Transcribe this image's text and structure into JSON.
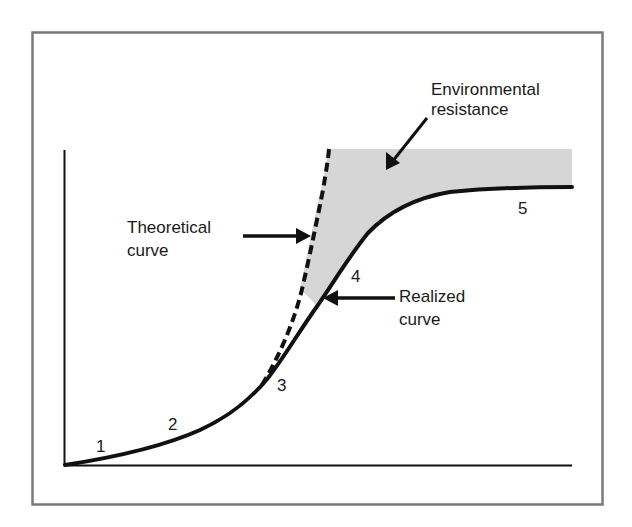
{
  "diagram": {
    "title": "",
    "type": "logistic growth curve",
    "colors": {
      "frame": "#7a7a7a",
      "axis": "#111111",
      "curve": "#111111",
      "shade": "#d6d6d6",
      "text": "#1a1a1a"
    },
    "labels": {
      "environmental_line1": "Environmental",
      "environmental_line2": "resistance",
      "theoretical_line1": "Theoretical",
      "theoretical_line2": "curve",
      "realized_line1": "Realized",
      "realized_line2": "curve"
    },
    "stages": [
      {
        "id": "1",
        "label": "1"
      },
      {
        "id": "2",
        "label": "2"
      },
      {
        "id": "3",
        "label": "3"
      },
      {
        "id": "4",
        "label": "4"
      },
      {
        "id": "5",
        "label": "5"
      }
    ]
  }
}
